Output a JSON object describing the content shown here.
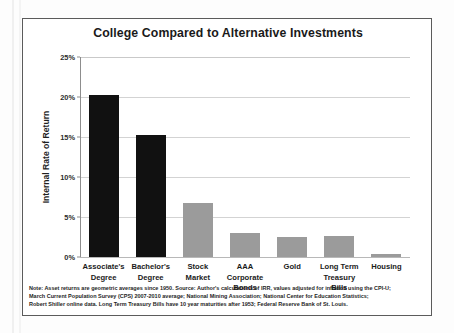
{
  "figure": {
    "title": "College Compared to Alternative Investments"
  },
  "axes": {
    "y_title": "Internal Rate of Return",
    "y_ticks": [
      "0%",
      "5%",
      "10%",
      "15%",
      "20%",
      "25%"
    ]
  },
  "notes": {
    "line1": "Note: Asset returns are geometric averages since 1950. Source: Author's calculations of IRR, values adjusted for inflation using the CPI-U;",
    "line2": "March Current Population Survey (CPS) 2007-2010 average; National Mining Association; National Center for Education Statistics;",
    "line3": "Robert Shiller online data. Long Term Treasury Bills have 10 year maturities after 1953; Federal Reserve Bank of St. Louis."
  },
  "colors": {
    "education_bar": "#111111",
    "asset_bar": "#9b9b9b",
    "gridline": "#d3d3d3",
    "frame": "#5b5b5b",
    "text": "#1a1a1a"
  },
  "chart_data": {
    "type": "bar",
    "title": "College Compared to Alternative Investments",
    "xlabel": "",
    "ylabel": "Internal Rate of Return",
    "ylim": [
      0,
      25
    ],
    "ytick_values": [
      0,
      5,
      10,
      15,
      20,
      25
    ],
    "ytick_labels": [
      "0%",
      "5%",
      "10%",
      "15%",
      "20%",
      "25%"
    ],
    "grid": true,
    "legend": "none",
    "units": "percent",
    "categories": [
      "Associate's Degree",
      "Bachelor's Degree",
      "Stock Market",
      "AAA Corporate Bonds",
      "Gold",
      "Long Term Treasury Bills",
      "Housing"
    ],
    "category_lines": [
      [
        "Associate's",
        "Degree"
      ],
      [
        "Bachelor's",
        "Degree"
      ],
      [
        "Stock",
        "Market"
      ],
      [
        "AAA Corporate",
        "Bonds"
      ],
      [
        "Gold",
        ""
      ],
      [
        "Long Term",
        "Treasury Bills"
      ],
      [
        "Housing",
        ""
      ]
    ],
    "values": [
      20.2,
      15.2,
      6.8,
      3.0,
      2.5,
      2.6,
      0.4
    ],
    "bar_colors": [
      "#111111",
      "#111111",
      "#9b9b9b",
      "#9b9b9b",
      "#9b9b9b",
      "#9b9b9b",
      "#9b9b9b"
    ]
  }
}
